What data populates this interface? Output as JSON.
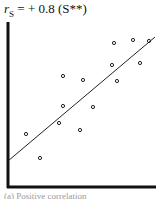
{
  "chart_data": {
    "type": "scatter",
    "title_parts": {
      "symbol": "r",
      "subscript": "S",
      "rest": " = + 0.8 (S**)"
    },
    "xlabel": "",
    "ylabel": "",
    "grid": false,
    "legend": "none",
    "axes": {
      "x_axis_y_px": 187,
      "y_axis_x_px": 8,
      "y_top_px": 22,
      "x_right_px": 155
    },
    "points_px": [
      [
        114,
        43
      ],
      [
        133,
        40
      ],
      [
        149,
        41
      ],
      [
        112,
        65
      ],
      [
        140,
        63
      ],
      [
        63,
        76
      ],
      [
        83,
        80
      ],
      [
        117,
        81
      ],
      [
        63,
        106
      ],
      [
        93,
        107
      ],
      [
        59,
        123
      ],
      [
        80,
        130
      ],
      [
        26,
        134
      ],
      [
        40,
        158
      ]
    ],
    "fit_line_px": [
      [
        8,
        161
      ],
      [
        155,
        37
      ]
    ],
    "correlation": 0.8,
    "significance": "S**"
  },
  "caption": "(a) Positive correlation"
}
